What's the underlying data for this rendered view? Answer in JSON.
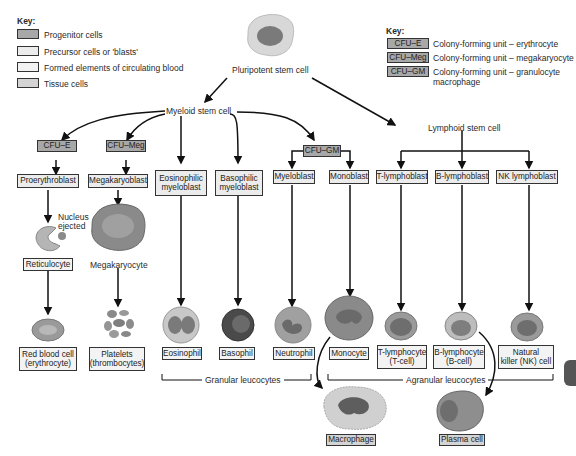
{
  "key_left": {
    "title": "Key:",
    "items": [
      {
        "label": "Progenitor cells",
        "color": "#a8a8a8"
      },
      {
        "label": "Precursor cells or 'blasts'",
        "color": "#ececec"
      },
      {
        "label": "Formed elements of circulating blood",
        "color": "#f3f3f3"
      },
      {
        "label": "Tissue cells",
        "color": "#d4d4d4"
      }
    ]
  },
  "key_right": {
    "title": "Key:",
    "items": [
      {
        "abbr": "CFU–E",
        "label": "Colony-forming unit – erythrocyte"
      },
      {
        "abbr": "CFU–Meg",
        "label": "Colony-forming unit – megakaryocyte"
      },
      {
        "abbr": "CFU–GM",
        "label": "Colony-forming unit – granulocyte",
        "label2": "macrophage"
      }
    ]
  },
  "stem": {
    "pluripotent": "Pluripotent stem cell",
    "myeloid": "Myeloid stem cell",
    "lymphoid": "Lymphoid stem cell"
  },
  "progenitors": {
    "cfu_e": "CFU–E",
    "cfu_meg": "CFU–Meg",
    "cfu_gm": "CFU–GM"
  },
  "blasts": {
    "proerythroblast": "Proerythroblast",
    "megakaryoblast": "Megakaryoblast",
    "eosinophilic": [
      "Eosinophilic",
      "myeloblast"
    ],
    "basophilic": [
      "Basophilic",
      "myeloblast"
    ],
    "myeloblast": "Myeloblast",
    "monoblast": "Monoblast",
    "t_lymphoblast": "T-lymphoblast",
    "b_lymphoblast": "B-lymphoblast",
    "nk_lymphoblast": "NK lymphoblast"
  },
  "intermediate": {
    "nucleus_ejected": [
      "Nucleus",
      "ejected"
    ],
    "reticulocyte": "Reticulocyte",
    "megakaryocyte": "Megakaryocyte"
  },
  "formed": {
    "rbc": [
      "Red blood cell",
      "(erythrocyte)"
    ],
    "platelets": [
      "Platelets",
      "(thrombocytes)"
    ],
    "eosinophil": "Eosinophil",
    "basophil": "Basophil",
    "neutrophil": "Neutrophil",
    "monocyte": "Monocyte",
    "t_lymphocyte": [
      "T-lymphocyte",
      "(T-cell)"
    ],
    "b_lymphocyte": [
      "B-lymphocyte",
      "(B-cell)"
    ],
    "nk_cell": [
      "Natural",
      "killer (NK) cell"
    ]
  },
  "groups": {
    "granular": "Granular leucocytes",
    "agranular": "Agranular leucocytes"
  },
  "tissue": {
    "macrophage": "Macrophage",
    "plasma_cell": "Plasma cell"
  }
}
